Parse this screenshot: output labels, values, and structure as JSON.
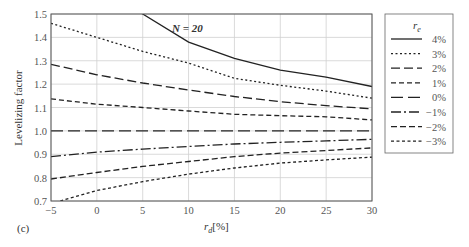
{
  "chart_data": {
    "type": "line",
    "title": "N = 20",
    "panel_label": "(c)",
    "xlabel": "r_d [%]",
    "xlabel_main": "r",
    "xlabel_sub": "d",
    "xlabel_unit": "[%]",
    "ylabel": "Levelizing factor",
    "xlim": [
      -5,
      30
    ],
    "ylim": [
      0.7,
      1.5
    ],
    "grid": true,
    "x_ticks": [
      -5,
      0,
      5,
      10,
      15,
      20,
      25,
      30
    ],
    "y_ticks": [
      0.7,
      0.8,
      0.9,
      1.0,
      1.1,
      1.2,
      1.3,
      1.4,
      1.5
    ],
    "y_tick_labels": [
      "0.7",
      "0.8",
      "0.9",
      "1.0",
      "1.1",
      "1.2",
      "1.3",
      "1.4",
      "1.5"
    ],
    "legend": {
      "title": "r_e",
      "title_main": "r",
      "title_sub": "e",
      "position": "right-outside",
      "entries": [
        "4%",
        "3%",
        "2%",
        "1%",
        "0%",
        "−1%",
        "−2%",
        "−3%"
      ]
    },
    "x": [
      -5,
      0,
      5,
      10,
      15,
      20,
      25,
      30
    ],
    "series": [
      {
        "name": "4%",
        "dash": "none",
        "values": [
          null,
          null,
          1.5,
          1.38,
          1.31,
          1.26,
          1.23,
          1.19
        ]
      },
      {
        "name": "3%",
        "dash": "2,2.5",
        "values": [
          1.46,
          1.4,
          1.34,
          1.29,
          1.225,
          1.195,
          1.17,
          1.14
        ]
      },
      {
        "name": "2%",
        "dash": "9,4",
        "values": [
          1.285,
          1.24,
          1.205,
          1.175,
          1.147,
          1.125,
          1.108,
          1.094
        ]
      },
      {
        "name": "1%",
        "dash": "5,3",
        "values": [
          1.137,
          1.114,
          1.1,
          1.085,
          1.071,
          1.065,
          1.06,
          1.047
        ]
      },
      {
        "name": "0%",
        "dash": "12,5",
        "values": [
          1.0,
          1.0,
          1.0,
          1.0,
          1.0,
          1.0,
          1.0,
          1.0
        ]
      },
      {
        "name": "−1%",
        "dash": "10,3,2,3",
        "values": [
          0.89,
          0.909,
          0.922,
          0.933,
          0.944,
          0.951,
          0.957,
          0.964
        ]
      },
      {
        "name": "−2%",
        "dash": "6,3",
        "values": [
          0.794,
          0.822,
          0.848,
          0.869,
          0.89,
          0.905,
          0.916,
          0.927
        ]
      },
      {
        "name": "−3%",
        "dash": "3,2.5",
        "values": [
          0.7,
          0.745,
          0.783,
          0.815,
          0.841,
          0.862,
          0.876,
          0.888
        ]
      }
    ],
    "colors": {
      "line": "#222222",
      "grid": "#d0d0d0",
      "axis": "#555555",
      "legend_last_line": "#2a2a8a"
    }
  }
}
